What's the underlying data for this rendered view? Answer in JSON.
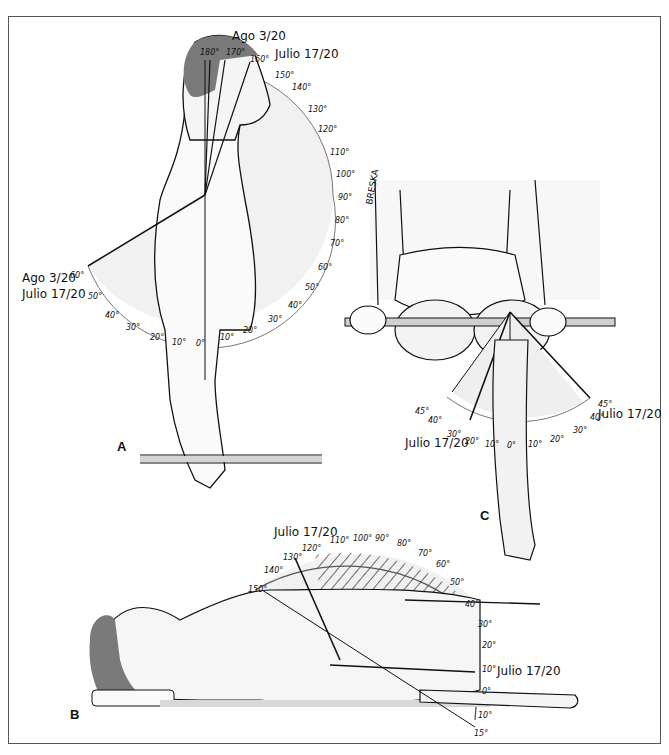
{
  "figure": {
    "panels": [
      {
        "id": "A",
        "label": "A",
        "description": "Shoulder flexion, standing lateral view",
        "annotations": {
          "top_left": "Ago 3/20",
          "top_right": "Julio 17/20",
          "side_1": "Ago 3/20",
          "side_2": "Julio 17/20"
        },
        "arc_ticks": [
          "180°",
          "170°",
          "160°",
          "150°",
          "140°",
          "130°",
          "120°",
          "110°",
          "100°",
          "90°",
          "80°",
          "70°",
          "60°",
          "50°",
          "40°",
          "30°",
          "20°",
          "10°",
          "0°",
          "10°",
          "20°",
          "30°",
          "40°",
          "50°",
          "60°"
        ]
      },
      {
        "id": "C",
        "label": "C",
        "description": "Hip rotation, seated anterior view",
        "signature": "BRESKA",
        "annotations": {
          "left": "Julio 17/20",
          "right": "Julio 17/20"
        },
        "arc_ticks_left": [
          "45°",
          "40°",
          "30°",
          "20°",
          "10°"
        ],
        "arc_center": "0°",
        "arc_ticks_right": [
          "10°",
          "20°",
          "30°",
          "40°",
          "45°"
        ]
      },
      {
        "id": "B",
        "label": "B",
        "description": "Shoulder abduction, supine view",
        "annotations": {
          "top": "Julio 17/20",
          "right": "Julio 17/20"
        },
        "arc_ticks": [
          "150°",
          "140°",
          "130°",
          "120°",
          "110°",
          "100°",
          "90°",
          "80°",
          "70°",
          "60°",
          "50°",
          "40°",
          "30°",
          "20°",
          "10°",
          "0°",
          "10°",
          "15°"
        ]
      }
    ],
    "colors": {
      "hair": "#7a7a7a",
      "skin_shade": "#e9e9e9",
      "line": "#111111",
      "arc_fill": "#f0f0f0",
      "frame": "#555555"
    }
  }
}
